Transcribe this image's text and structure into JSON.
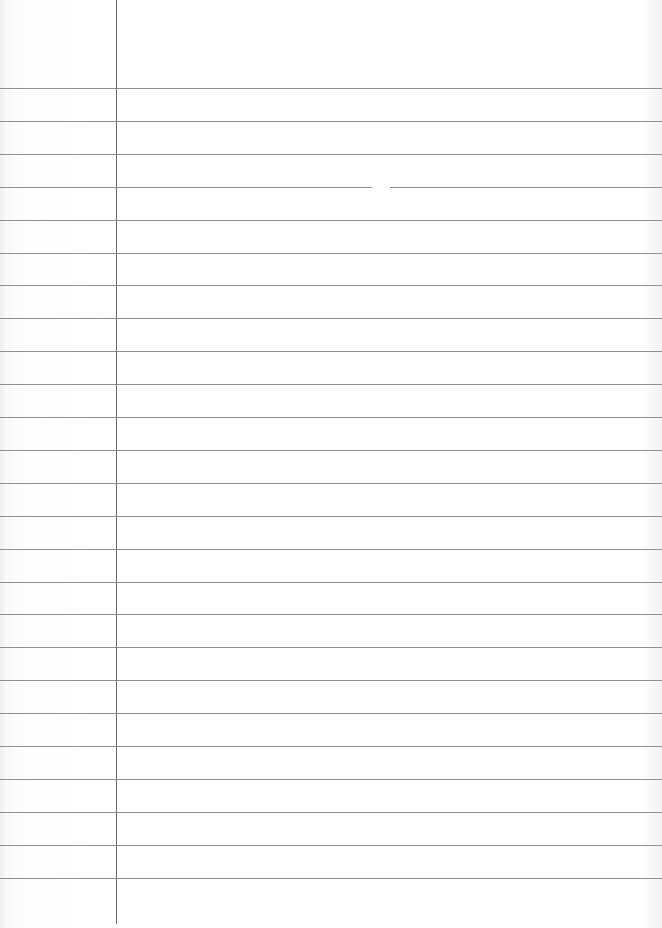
{
  "paper": {
    "type": "ruled-lined-paper",
    "background_color": "#ffffff",
    "rule_color": "#7d7d7d",
    "margin_line_color": "#6e6e6e",
    "margin_line_x": 116,
    "rule_count": 25,
    "first_rule_y": 88,
    "rule_spacing": 32.9,
    "text_content": ""
  }
}
